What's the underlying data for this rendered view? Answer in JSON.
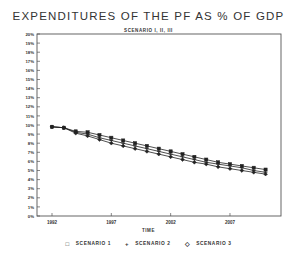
{
  "chart_data": {
    "type": "line",
    "title": "EXPENDITURES OF THE PF AS % OF GDP",
    "subtitle": "SCENARIO I, II, III",
    "xlabel": "TIME",
    "ylabel": "",
    "x": [
      1992,
      1993,
      1994,
      1995,
      1996,
      1997,
      1998,
      1999,
      2000,
      2001,
      2002,
      2003,
      2004,
      2005,
      2006,
      2007,
      2008,
      2009,
      2010
    ],
    "xticks": [
      1992,
      1997,
      2002,
      2007
    ],
    "xlim": [
      1992,
      2011.3
    ],
    "ylim": [
      0,
      20
    ],
    "yticks": [
      "0%",
      "1%",
      "2%",
      "3%",
      "4%",
      "5%",
      "6%",
      "7%",
      "8%",
      "9%",
      "10%",
      "11%",
      "12%",
      "13%",
      "14%",
      "15%",
      "16%",
      "17%",
      "18%",
      "19%",
      "20%"
    ],
    "grid": false,
    "legend_position": "bottom",
    "series": [
      {
        "name": "SCENARIO 1",
        "marker": "square",
        "values": [
          9.8,
          9.7,
          9.3,
          9.2,
          8.9,
          8.6,
          8.3,
          8.0,
          7.7,
          7.4,
          7.1,
          6.8,
          6.5,
          6.2,
          5.9,
          5.7,
          5.5,
          5.3,
          5.1
        ]
      },
      {
        "name": "SCENARIO 2",
        "marker": "plus",
        "values": [
          9.8,
          9.7,
          9.2,
          9.0,
          8.6,
          8.3,
          8.0,
          7.7,
          7.4,
          7.1,
          6.8,
          6.5,
          6.2,
          5.9,
          5.7,
          5.5,
          5.3,
          5.0,
          4.8
        ]
      },
      {
        "name": "SCENARIO 3",
        "marker": "diamond",
        "values": [
          9.8,
          9.7,
          9.1,
          8.8,
          8.4,
          8.0,
          7.7,
          7.4,
          7.1,
          6.8,
          6.5,
          6.2,
          5.9,
          5.7,
          5.4,
          5.2,
          5.0,
          4.8,
          4.6
        ]
      }
    ]
  },
  "legend": {
    "items": [
      {
        "symbol": "□",
        "label": "SCENARIO 1"
      },
      {
        "symbol": "+",
        "label": "SCENARIO 2"
      },
      {
        "symbol": "◇",
        "label": "SCENARIO 3"
      }
    ]
  }
}
